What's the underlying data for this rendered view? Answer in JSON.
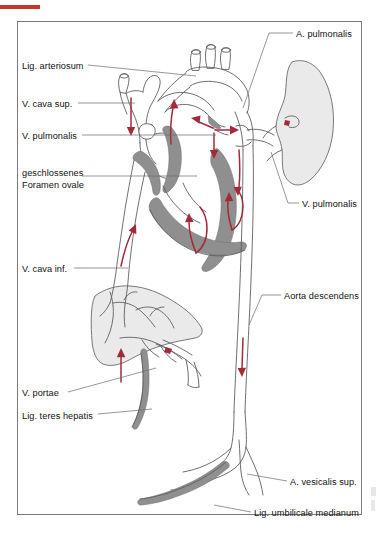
{
  "figure": {
    "language": "de",
    "frame_color": "#7a7a7a",
    "background_color": "#ffffff",
    "accent_bar_color": "#c0392b",
    "arrow_color": "#a52a38",
    "vessel_wall_color": "#8c8c8c",
    "organ_fill_color": "#e9e9e9",
    "outline_color": "#5a5a5a"
  },
  "labels_left": [
    {
      "id": "lig-arteriosum",
      "text": "Lig. arteriosum",
      "x": 22,
      "y": 61,
      "leader_to_x": 196,
      "leader_to_y": 76
    },
    {
      "id": "v-cava-sup",
      "text": "V. cava sup.",
      "x": 22,
      "y": 99,
      "leader_to_x": 135,
      "leader_to_y": 104
    },
    {
      "id": "v-pulmonalis-left",
      "text": "V. pulmonalis",
      "x": 22,
      "y": 131,
      "leader_to_x": 215,
      "leader_to_y": 136
    },
    {
      "id": "geschlossenes-foramen-ovale",
      "text": "geschlossenes\nForamen ovale",
      "x": 22,
      "y": 168,
      "leader_to_x": 197,
      "leader_to_y": 176
    },
    {
      "id": "v-cava-inf",
      "text": "V. cava inf.",
      "x": 22,
      "y": 264,
      "leader_to_x": 128,
      "leader_to_y": 270
    },
    {
      "id": "v-portae",
      "text": "V. portae",
      "x": 22,
      "y": 388,
      "leader_to_x": 155,
      "leader_to_y": 368
    },
    {
      "id": "lig-teres-hepatis",
      "text": "Lig. teres hepatis",
      "x": 22,
      "y": 411,
      "leader_to_x": 152,
      "leader_to_y": 410
    }
  ],
  "labels_right": [
    {
      "id": "a-pulmonalis",
      "text": "A. pulmonalis",
      "x": 296,
      "y": 29,
      "leader_to_x": 267,
      "leader_to_y": 110
    },
    {
      "id": "v-pulmonalis-right",
      "text": "V. pulmonalis",
      "x": 302,
      "y": 199,
      "leader_to_x": 268,
      "leader_to_y": 150
    },
    {
      "id": "aorta-descendens",
      "text": "Aorta descendens",
      "x": 284,
      "y": 291,
      "leader_to_x": 250,
      "leader_to_y": 330
    },
    {
      "id": "a-vesicalis-sup",
      "text": "A. vesicalis sup.",
      "x": 290,
      "y": 477,
      "leader_to_x": 243,
      "leader_to_y": 472
    },
    {
      "id": "lig-umbilicale-medianum",
      "text": "Lig. umbilicale medianum",
      "x": 254,
      "y": 508,
      "leader_to_x": 218,
      "leader_to_y": 505
    }
  ],
  "flow_arrows": [
    {
      "id": "arrow-vcs-down",
      "direction": "down",
      "structure": "V. cava superior"
    },
    {
      "id": "arrow-ra-up",
      "direction": "up",
      "structure": "right atrium"
    },
    {
      "id": "arrow-arch-left",
      "direction": "left",
      "structure": "aortic arch"
    },
    {
      "id": "arrow-arch-right",
      "direction": "right",
      "structure": "aortic arch"
    },
    {
      "id": "arrow-arch-down",
      "direction": "down",
      "structure": "ascending aorta"
    },
    {
      "id": "arrow-pulm-trunk-down",
      "direction": "down",
      "structure": "pulmonary trunk"
    },
    {
      "id": "arrow-lv-up",
      "direction": "up",
      "structure": "left ventricle"
    },
    {
      "id": "arrow-rv-up",
      "direction": "up",
      "structure": "right ventricle"
    },
    {
      "id": "arrow-vci-up",
      "direction": "up",
      "structure": "V. cava inferior"
    },
    {
      "id": "arrow-aorta-desc-down",
      "direction": "down",
      "structure": "aorta descendens"
    },
    {
      "id": "arrow-portal-up",
      "direction": "up",
      "structure": "V. portae / liver"
    }
  ],
  "organs": [
    {
      "id": "lung-right",
      "name": "lung"
    },
    {
      "id": "liver",
      "name": "liver"
    },
    {
      "id": "heart",
      "name": "heart"
    }
  ]
}
